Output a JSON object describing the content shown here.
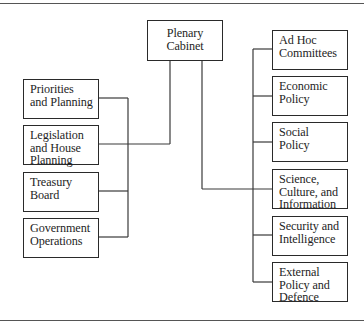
{
  "diagram": {
    "type": "organization-chart",
    "root": {
      "id": "plenary",
      "lines": [
        "Plenary",
        "Cabinet"
      ]
    },
    "left_branch": {
      "joins_root_at": "legislation",
      "items": [
        {
          "id": "priorities",
          "lines": [
            "Priorities",
            "and Planning"
          ]
        },
        {
          "id": "legislation",
          "lines": [
            "Legislation",
            "and House",
            "Planning"
          ]
        },
        {
          "id": "treasury",
          "lines": [
            "Treasury",
            "Board"
          ]
        },
        {
          "id": "government",
          "lines": [
            "Government",
            "Operations"
          ]
        }
      ]
    },
    "right_branch": {
      "joins_root_at": "science",
      "items": [
        {
          "id": "adhoc",
          "lines": [
            "Ad Hoc",
            "Committees"
          ]
        },
        {
          "id": "economic",
          "lines": [
            "Economic",
            "Policy"
          ]
        },
        {
          "id": "social",
          "lines": [
            "Social",
            "Policy"
          ]
        },
        {
          "id": "science",
          "lines": [
            "Science,",
            "Culture, and",
            "Information"
          ]
        },
        {
          "id": "security",
          "lines": [
            "Security and",
            "Intelligence"
          ]
        },
        {
          "id": "external",
          "lines": [
            "External",
            "Policy and",
            "Defence"
          ]
        }
      ]
    },
    "colors": {
      "line": "#3a3a3a",
      "box_border": "#2a2a2a",
      "text": "#1e1e1e",
      "background": "#ffffff"
    }
  }
}
